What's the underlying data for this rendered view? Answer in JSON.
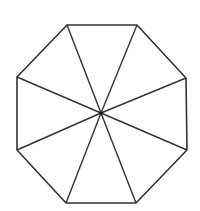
{
  "diagram": {
    "title": "",
    "shape": "regular octagon divided into 8 triangles from center",
    "stroke_color": "#333333",
    "background": "#ffffff",
    "center": [
      101,
      113
    ],
    "vertices": [
      [
        67,
        25
      ],
      [
        137,
        25
      ],
      [
        186,
        78
      ],
      [
        187,
        150
      ],
      [
        136,
        203
      ],
      [
        66,
        203
      ],
      [
        17,
        150
      ],
      [
        17,
        77
      ]
    ],
    "labels": []
  }
}
